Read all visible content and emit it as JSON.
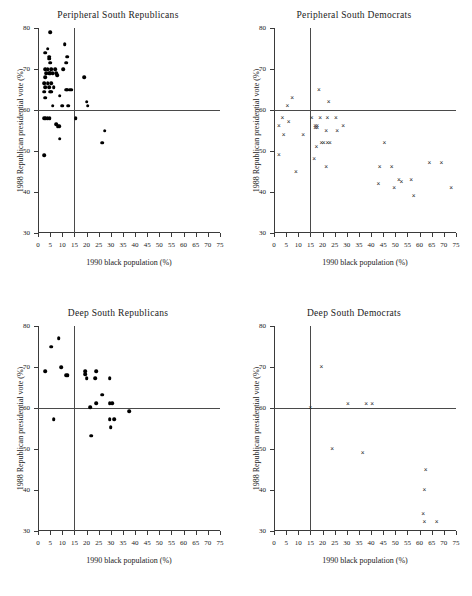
{
  "figure": {
    "axis": {
      "xlabel": "1990 black population (%)",
      "ylabel": "1988 Republican  presidential  vote  (%)",
      "xlim": [
        0,
        75
      ],
      "ylim": [
        30,
        80
      ],
      "xticks": [
        0,
        5,
        10,
        15,
        20,
        25,
        30,
        35,
        40,
        45,
        50,
        55,
        60,
        65,
        70,
        75
      ],
      "yticks": [
        30,
        40,
        50,
        60,
        70,
        80
      ],
      "ref_x": 15,
      "ref_y": 60,
      "grid": false
    }
  },
  "chart_data": [
    {
      "type": "scatter",
      "title": "Peripheral  South Republicans",
      "marker": "filled-circle",
      "xlabel": "1990 black population (%)",
      "ylabel": "1988 Republican  presidential  vote  (%)",
      "xlim": [
        0,
        75
      ],
      "ylim": [
        30,
        80
      ],
      "reference_lines": {
        "vertical_x": 15,
        "horizontal_y": 60
      },
      "points": [
        [
          5,
          79
        ],
        [
          4,
          75
        ],
        [
          3,
          74
        ],
        [
          11,
          76
        ],
        [
          4.5,
          73
        ],
        [
          4.5,
          72.5
        ],
        [
          12,
          73
        ],
        [
          5,
          71.5
        ],
        [
          11.5,
          71.5
        ],
        [
          3,
          70
        ],
        [
          4,
          70
        ],
        [
          5.5,
          70
        ],
        [
          7,
          70
        ],
        [
          10.5,
          70
        ],
        [
          3.5,
          69
        ],
        [
          4.5,
          69
        ],
        [
          5,
          69
        ],
        [
          6,
          69
        ],
        [
          7.5,
          69
        ],
        [
          3,
          68
        ],
        [
          8,
          68.5
        ],
        [
          19,
          68
        ],
        [
          2.5,
          66.5
        ],
        [
          4,
          66.5
        ],
        [
          5.5,
          66.5
        ],
        [
          3,
          65.5
        ],
        [
          4.5,
          65.5
        ],
        [
          6.5,
          65.5
        ],
        [
          12,
          65
        ],
        [
          13,
          65
        ],
        [
          13.8,
          65
        ],
        [
          2.5,
          64.5
        ],
        [
          5,
          64.5
        ],
        [
          5.5,
          64.5
        ],
        [
          11.5,
          65
        ],
        [
          3,
          63
        ],
        [
          9,
          63.5
        ],
        [
          6,
          61
        ],
        [
          10,
          61
        ],
        [
          12.5,
          61
        ],
        [
          20.5,
          61
        ],
        [
          20,
          62
        ],
        [
          2.5,
          58
        ],
        [
          3.2,
          58
        ],
        [
          4,
          58
        ],
        [
          4.8,
          58
        ],
        [
          15.5,
          58
        ],
        [
          7.5,
          56.5
        ],
        [
          8.2,
          56
        ],
        [
          8.8,
          56
        ],
        [
          27.5,
          55
        ],
        [
          9,
          53
        ],
        [
          26.5,
          52
        ],
        [
          2.5,
          49
        ]
      ]
    },
    {
      "type": "scatter",
      "title": "Peripheral South Democrats",
      "marker": "cross",
      "xlabel": "1990 black population (%)",
      "ylabel": "1988 Republican  presidential  vote  (%)",
      "xlim": [
        0,
        75
      ],
      "ylim": [
        30,
        80
      ],
      "reference_lines": {
        "vertical_x": 15,
        "horizontal_y": 60
      },
      "points": [
        [
          18.5,
          65
        ],
        [
          7.5,
          63
        ],
        [
          5.5,
          61
        ],
        [
          22.5,
          62
        ],
        [
          3.5,
          58
        ],
        [
          15.5,
          58
        ],
        [
          19,
          58
        ],
        [
          22,
          58
        ],
        [
          25.5,
          58
        ],
        [
          6,
          57
        ],
        [
          2,
          56
        ],
        [
          17,
          56
        ],
        [
          17.8,
          56
        ],
        [
          28.5,
          56
        ],
        [
          17,
          55.5
        ],
        [
          17.8,
          55.5
        ],
        [
          21.5,
          55
        ],
        [
          26,
          55
        ],
        [
          4,
          54
        ],
        [
          12,
          54
        ],
        [
          45.5,
          52
        ],
        [
          17.5,
          51
        ],
        [
          19.5,
          52
        ],
        [
          20.5,
          52
        ],
        [
          22,
          52
        ],
        [
          23,
          52
        ],
        [
          2,
          49
        ],
        [
          16.5,
          48
        ],
        [
          21.5,
          46
        ],
        [
          43.5,
          46
        ],
        [
          48.5,
          46
        ],
        [
          64,
          47
        ],
        [
          69,
          47
        ],
        [
          9,
          45
        ],
        [
          43,
          42
        ],
        [
          56.5,
          43
        ],
        [
          51.5,
          43
        ],
        [
          52.5,
          42.5
        ],
        [
          49.5,
          41
        ],
        [
          73,
          41
        ],
        [
          57.5,
          39
        ]
      ]
    },
    {
      "type": "scatter",
      "title": "Deep South Republicans",
      "marker": "filled-circle",
      "xlabel": "1990 black population (%)",
      "ylabel": "1988 Republican  presidential  vote  (%)",
      "xlim": [
        0,
        75
      ],
      "ylim": [
        30,
        80
      ],
      "reference_lines": {
        "vertical_x": 15,
        "horizontal_y": 60
      },
      "points": [
        [
          8.5,
          77
        ],
        [
          5.5,
          75
        ],
        [
          9.5,
          70
        ],
        [
          3,
          69
        ],
        [
          11.5,
          68
        ],
        [
          12.2,
          68
        ],
        [
          19.5,
          69
        ],
        [
          19.5,
          68.3
        ],
        [
          24,
          69
        ],
        [
          20,
          67.3
        ],
        [
          23.5,
          67.2
        ],
        [
          29.5,
          67.2
        ],
        [
          26.5,
          63.2
        ],
        [
          24,
          61.2
        ],
        [
          29.5,
          61.2
        ],
        [
          30.5,
          61.2
        ],
        [
          21.5,
          60.2
        ],
        [
          37.5,
          59.2
        ],
        [
          6.5,
          57.3
        ],
        [
          29.5,
          57.3
        ],
        [
          31.5,
          57.3
        ],
        [
          30,
          55.3
        ],
        [
          22,
          53.2
        ]
      ]
    },
    {
      "type": "scatter",
      "title": "Deep South Democrats",
      "marker": "cross",
      "xlabel": "1990 black population (%)",
      "ylabel": "1988 Republican  presidential  vote  (%)",
      "xlim": [
        0,
        75
      ],
      "ylim": [
        30,
        80
      ],
      "reference_lines": {
        "vertical_x": 15,
        "horizontal_y": 60
      },
      "points": [
        [
          19.5,
          70
        ],
        [
          15,
          60
        ],
        [
          30.5,
          61
        ],
        [
          38,
          61
        ],
        [
          40.5,
          61
        ],
        [
          24,
          50
        ],
        [
          36.5,
          49
        ],
        [
          62.5,
          45
        ],
        [
          62,
          40
        ],
        [
          61.5,
          34.2
        ],
        [
          62,
          32.2
        ],
        [
          67,
          32.2
        ]
      ]
    }
  ]
}
